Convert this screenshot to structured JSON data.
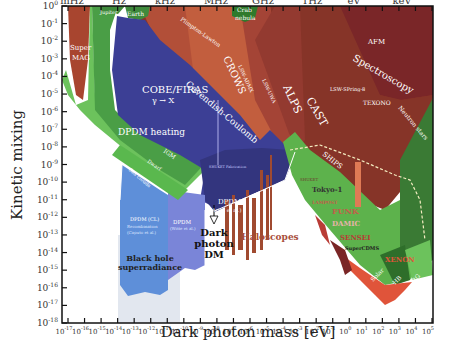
{
  "chart_data": {
    "type": "area",
    "title": "",
    "xlabel": "Dark photon mass [eV]",
    "ylabel": "Kinetic mixing",
    "xscale": "log",
    "yscale": "log",
    "xlim": [
      "1e-17",
      "1e5"
    ],
    "ylim": [
      "1e-18",
      "1e0"
    ],
    "x_ticks": [
      "10^-17",
      "10^-16",
      "10^-15",
      "10^-14",
      "10^-13",
      "10^-12",
      "10^-11",
      "10^-10",
      "10^-9",
      "10^-8",
      "10^-7",
      "10^-6",
      "10^-5",
      "10^-4",
      "10^-3",
      "10^-2",
      "10^-1",
      "10^0",
      "10^1",
      "10^2",
      "10^3",
      "10^4",
      "10^5"
    ],
    "y_ticks": [
      "10^0",
      "10^-1",
      "10^-2",
      "10^-3",
      "10^-4",
      "10^-5",
      "10^-6",
      "10^-7",
      "10^-8",
      "10^-9",
      "10^-10",
      "10^-11",
      "10^-12",
      "10^-13",
      "10^-14",
      "10^-15",
      "10^-16",
      "10^-17",
      "10^-18"
    ],
    "top_axis_labels": [
      "mHz",
      "Hz",
      "kHz",
      "MHz",
      "GHz",
      "THz",
      "eV",
      "keV"
    ],
    "grid": false,
    "legend": "none (regions labeled inline)",
    "regions": [
      {
        "name": "Super MAG",
        "category": "experiment",
        "color": "#a8452f"
      },
      {
        "name": "Jupiter",
        "category": "astrophysics",
        "color": "#3f8a3c"
      },
      {
        "name": "Earth",
        "category": "astrophysics",
        "color": "#3f8a3c"
      },
      {
        "name": "Plimpton-Lawton",
        "category": "experiment",
        "color": "#c0553a"
      },
      {
        "name": "Crab nebula",
        "category": "astrophysics",
        "color": "#2f7a2c"
      },
      {
        "name": "AFM",
        "category": "experiment",
        "color": "#7a2628"
      },
      {
        "name": "Spectroscopy",
        "category": "experiment",
        "color": "#8a2f2f"
      },
      {
        "name": "LSW-SPring-8",
        "category": "experiment",
        "color": "#8a3a2a"
      },
      {
        "name": "TEXONO",
        "category": "experiment",
        "color": "#8a3a2a"
      },
      {
        "name": "Neutron stars",
        "category": "astrophysics",
        "color": "#3a7a34"
      },
      {
        "name": "COBE/FIRAS γ → X",
        "category": "cosmology",
        "color": "#3c3f95"
      },
      {
        "name": "Cavendish-Coulomb",
        "category": "experiment",
        "color": "#c25a3a"
      },
      {
        "name": "CROWS",
        "category": "experiment",
        "color": "#b9553b"
      },
      {
        "name": "LSW-ADMX",
        "category": "experiment",
        "color": "#a94a3a"
      },
      {
        "name": "LSW-UWA",
        "category": "experiment",
        "color": "#a04236"
      },
      {
        "name": "ALPS",
        "category": "experiment",
        "color": "#983c32"
      },
      {
        "name": "CAST",
        "category": "experiment",
        "color": "#8f3a2c"
      },
      {
        "name": "DPDM heating",
        "category": "cosmology",
        "color": "#6cc25c"
      },
      {
        "name": "IGM",
        "category": "cosmology",
        "color": "#4a9446"
      },
      {
        "name": "DPDM (Arias et al.)",
        "category": "cosmology",
        "color": "#3a3a85"
      },
      {
        "name": "SHUKET Fabrication",
        "category": "experiment",
        "color": "#8888cc"
      },
      {
        "name": "Dwarf",
        "category": "astrophysics",
        "color": "#5ab84e"
      },
      {
        "name": "Gas clouds",
        "category": "astrophysics",
        "color": "#5ab84e"
      },
      {
        "name": "DPDM (Recombination, Caputo et al.)",
        "category": "cosmology",
        "color": "#5e8fd9"
      },
      {
        "name": "DPDM (Witte et al.)",
        "category": "cosmology",
        "color": "#7a85d8"
      },
      {
        "name": "SHIPS",
        "category": "experiment",
        "color": "#4faa3f"
      },
      {
        "name": "Haloscopes",
        "category": "dark matter search",
        "color": "#a04a30"
      },
      {
        "name": "SHUKET",
        "category": "dark matter search",
        "color": "#a04a30"
      },
      {
        "name": "Tokyo-1",
        "category": "dark matter search",
        "color": "#a04a30"
      },
      {
        "name": "LAMPOST",
        "category": "dark matter search",
        "color": "#c0604a"
      },
      {
        "name": "FUNK",
        "category": "dark matter search",
        "color": "#c0604a"
      },
      {
        "name": "DAMIC",
        "category": "dark matter search",
        "color": "#e7b3a8"
      },
      {
        "name": "SENSEI",
        "category": "dark matter search",
        "color": "#b93c36"
      },
      {
        "name": "SuperCDMS",
        "category": "dark matter search",
        "color": "#7a2626"
      },
      {
        "name": "XENON",
        "category": "dark matter search",
        "color": "#e0543a"
      },
      {
        "name": "Solar",
        "category": "astrophysics",
        "color": "#3a8a34"
      },
      {
        "name": "HB",
        "category": "astrophysics",
        "color": "#2e6e2a"
      },
      {
        "name": "RG",
        "category": "astrophysics",
        "color": "#6cc25c"
      },
      {
        "name": "Black hole superradiance",
        "category": "astrophysics",
        "color": "#dfe5ee"
      }
    ],
    "annotations": [
      "Dark photon DM",
      "Black hole superradiance"
    ]
  },
  "labels": {
    "xlabel": "Dark photon mass [eV]",
    "ylabel": "Kinetic mixing",
    "top": [
      "mHz",
      "Hz",
      "kHz",
      "MHz",
      "GHz",
      "THz",
      "eV",
      "keV"
    ],
    "xt_exp": [
      "-17",
      "-16",
      "-15",
      "-14",
      "-13",
      "-12",
      "-11",
      "-10",
      "-9",
      "-8",
      "-7",
      "-6",
      "-5",
      "-4",
      "-3",
      "-2",
      "-1",
      "0",
      "1",
      "2",
      "3",
      "4",
      "5"
    ],
    "yt_exp": [
      "0",
      "-1",
      "-2",
      "-3",
      "-4",
      "-5",
      "-6",
      "-7",
      "-8",
      "-9",
      "-10",
      "-11",
      "-12",
      "-13",
      "-14",
      "-15",
      "-16",
      "-17",
      "-18"
    ],
    "ten": "10",
    "supermag1": "Super",
    "supermag2": "MAG",
    "jupiter": "Jupiter",
    "earth": "Earth",
    "plimpton": "Plimpton-Lawton",
    "crab1": "Crab",
    "crab2": "nebula",
    "afm": "AFM",
    "spectroscopy": "Spectroscopy",
    "spring8": "LSW-SPring-8",
    "texono": "TEXONO",
    "neutron": "Neutron stars",
    "cobe1": "COBE/FIRAS",
    "cobe2": "γ → X",
    "cavendish": "Cavendish-Coulomb",
    "crows": "CROWS",
    "admx": "LSW-ADMX",
    "uwa": "LSW-UWA",
    "alps": "ALPS",
    "cast": "CAST",
    "dpdmheat": "DPDM heating",
    "igm": "IGM",
    "dpdm_arias1": "DPDM",
    "dpdm_arias2": "(Arias et al.)",
    "shuket_fab": "SHUKET Fabrication",
    "dwarf": "Dwarf",
    "gasclouds": "Gas clouds",
    "dpdm_rec1": "DPDM (CL)",
    "dpdm_rec2": "Recombination",
    "dpdm_rec3": "(Caputo et al.)",
    "dpdm_w1": "DPDM",
    "dpdm_w2": "(Witte et al.)",
    "ships": "SHIPS",
    "dpdm_ann1": "Dark",
    "dpdm_ann2": "photon",
    "dpdm_ann3": "DM",
    "haloscopes": "Haloscopes",
    "shuket": "SHUKET",
    "tokyo": "Tokyo-1",
    "lampost": "LAMPOST",
    "funk": "FUNK",
    "damic": "DAMIC",
    "sensei": "SENSEI",
    "supercdms": "SuperCDMS",
    "xenon": "XENON",
    "solar": "Solar",
    "hb": "HB",
    "rg": "RG",
    "bh1": "Black hole",
    "bh2": "superradiance"
  }
}
